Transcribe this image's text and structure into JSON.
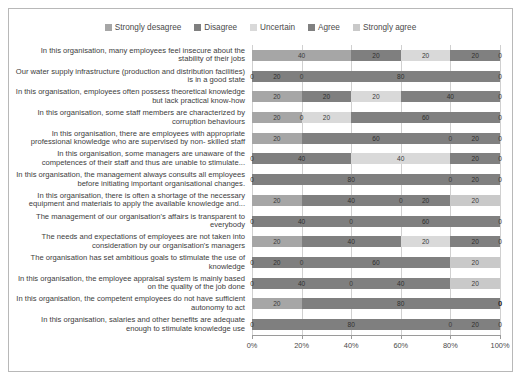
{
  "chart_data": {
    "type": "bar",
    "subtype": "stacked-horizontal-100percent",
    "title": "",
    "xlabel": "",
    "ylabel": "",
    "xlim": [
      0,
      100
    ],
    "xticks": [
      0,
      20,
      40,
      60,
      80,
      100
    ],
    "xtick_labels": [
      "0%",
      "20%",
      "40%",
      "60%",
      "80%",
      "100%"
    ],
    "grid": true,
    "legend_position": "top",
    "data_labels": true,
    "colors": {
      "strongly_desagree": "#a6a6a6",
      "disagree": "#7f7f7f",
      "uncertain": "#d9d9d9",
      "agree": "#808080",
      "strongly_agree": "#c9c9c9"
    },
    "series": [
      {
        "name": "Strongly desagree",
        "values": [
          40,
          0,
          20,
          20,
          20,
          0,
          0,
          20,
          0,
          20,
          0,
          0,
          20,
          0
        ]
      },
      {
        "name": "Disagree",
        "values": [
          20,
          20,
          20,
          0,
          60,
          40,
          80,
          40,
          40,
          40,
          20,
          40,
          80,
          80
        ]
      },
      {
        "name": "Uncertain",
        "values": [
          20,
          0,
          20,
          20,
          0,
          40,
          0,
          0,
          0,
          20,
          0,
          0,
          0,
          0
        ]
      },
      {
        "name": "Agree",
        "values": [
          20,
          80,
          40,
          60,
          20,
          20,
          20,
          20,
          60,
          20,
          60,
          40,
          0,
          20
        ]
      },
      {
        "name": "Strongly agree",
        "values": [
          0,
          0,
          0,
          0,
          0,
          0,
          0,
          20,
          0,
          0,
          20,
          20,
          0,
          0
        ]
      }
    ],
    "categories": [
      "In this organisation, many employees feel insecure about the stability of their jobs",
      "Our water supply infrastructure (production and distribution facilities) is in a good state",
      "In this organisation, employees often possess theoretical knowledge but lack practical know-how",
      "In this organisation, some staff members are characterized by corruption behaviours",
      "In this organisation, there are employees with appropriate professional knowledge who are supervised by non- skilled staff",
      "In this organisation, some managers are unaware of the competences of their staff and thus are unable to stimulate...",
      "In this organisation, the management always consults all employees before initiating important organisational changes.",
      "In this organisation, there is often a shortage of the necessary equipment and materials to apply the available knowledge and...",
      "The management of our organisation's affairs is transparent to everybody",
      "The needs and expectations of employees are not taken into consideration by our organisation's managers",
      "The organisation has set ambitious goals to stimulate the use of knowledge",
      "In this organisation, the employee appraisal system  is mainly based on the quality of the job done",
      "In this organisation, the competent employees do not have sufficient autonomy to act",
      "In this organisation, salaries and other benefits are adequate enough to stimulate knowledge use"
    ]
  },
  "legend": {
    "items": [
      {
        "label": "Strongly desagree",
        "color": "#a6a6a6"
      },
      {
        "label": "Disagree",
        "color": "#7f7f7f"
      },
      {
        "label": "Uncertain",
        "color": "#d9d9d9"
      },
      {
        "label": "Agree",
        "color": "#808080"
      },
      {
        "label": "Strongly agree",
        "color": "#c9c9c9"
      }
    ]
  }
}
